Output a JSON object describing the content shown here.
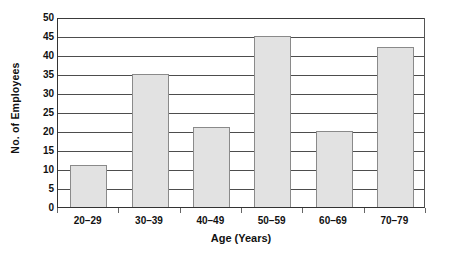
{
  "chart_data": {
    "type": "bar",
    "title": "",
    "subtitle": "",
    "xlabel": "Age (Years)",
    "ylabel": "No. of Employees",
    "categories": [
      "20–29",
      "30–39",
      "40–49",
      "50–59",
      "60–69",
      "70–79"
    ],
    "values": [
      11,
      35,
      21,
      45,
      20,
      42
    ],
    "series": [
      {
        "name": "No. of Employees",
        "values": [
          11,
          35,
          21,
          45,
          20,
          42
        ]
      }
    ],
    "ylim": [
      0,
      50
    ],
    "ytick_step": 5,
    "ytick_labels": [
      "0",
      "5",
      "10",
      "15",
      "20",
      "25",
      "30",
      "35",
      "40",
      "45",
      "50"
    ],
    "ytick_values": [
      0,
      5,
      10,
      15,
      20,
      25,
      30,
      35,
      40,
      45,
      50
    ],
    "grid": "horizontal",
    "legend": "none",
    "annotations": [],
    "colors": {
      "bar_fill": "#e2e2e2",
      "bar_border": "#8a8a8a",
      "axis": "#333333",
      "gridline": "#4d4d4d",
      "background": "#ffffff",
      "text": "#111111"
    }
  }
}
